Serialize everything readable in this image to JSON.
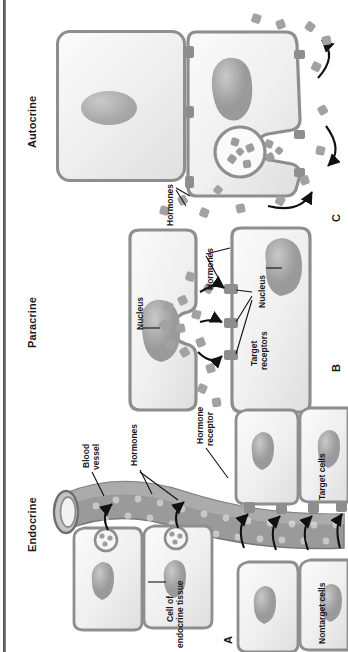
{
  "figure": {
    "kind": "hormone-signaling-diagram",
    "orientation": "rotated-90-ccw",
    "background": "#ffffff",
    "ink": "#1a1a1a",
    "cell_border": "#8e8e8e",
    "cell_fill_light": "#fbfbfb",
    "cell_fill_dark": "#e0e0e0",
    "vessel_gray": "#9a9a9a",
    "hormone_gray": "#a2a2a2"
  },
  "panels": [
    {
      "letter": "A",
      "title": "Endocrine",
      "labels": [
        "Blood vessel",
        "Hormones",
        "Hormone receptor",
        "Cell of endocrine tissue",
        "Target cells",
        "Nontarget cells"
      ]
    },
    {
      "letter": "B",
      "title": "Paracrine",
      "labels": [
        "Nucleus",
        "Hormones",
        "Nucleus",
        "Target receptors"
      ]
    },
    {
      "letter": "C",
      "title": "Autocrine",
      "labels": [
        "Hormones"
      ]
    }
  ],
  "titles": {
    "autocrine": "Autocrine",
    "paracrine": "Paracrine",
    "endocrine": "Endocrine"
  },
  "letters": {
    "a": "A",
    "b": "B",
    "c": "C"
  },
  "text": {
    "blood_vessel_l1": "Blood",
    "blood_vessel_l2": "vessel",
    "hormones_a": "Hormones",
    "hormone_receptor_l1": "Hormone",
    "hormone_receptor_l2": "receptor",
    "cell_of_l1": "Cell of",
    "cell_of_l2": "endocrine tissue",
    "target_cells": "Target cells",
    "nontarget_cells": "Nontarget cells",
    "nucleus_b_top": "Nucleus",
    "nucleus_b_bottom": "Nucleus",
    "hormones_b": "Hormones",
    "target_receptors_l1": "Target",
    "target_receptors_l2": "receptors",
    "hormones_c": "Hormones"
  }
}
